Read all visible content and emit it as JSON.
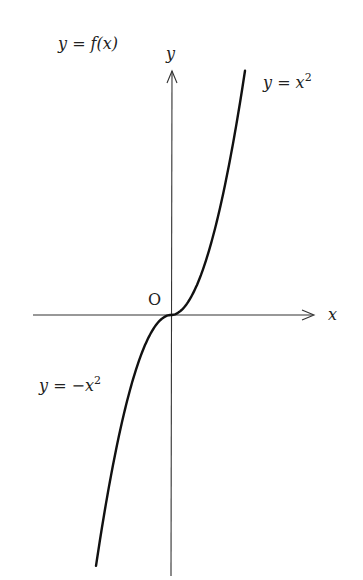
{
  "title": "y = f(x)",
  "axes": {
    "x_label": "x",
    "y_label": "y",
    "origin_label": "O"
  },
  "curves": [
    {
      "label": "y = x",
      "exponent": "2",
      "domain": "x ≥ 0",
      "expression": "x^2"
    },
    {
      "label": "y = −x",
      "exponent": "2",
      "domain": "x ≤ 0",
      "expression": "-x^2"
    }
  ],
  "colors": {
    "axis": "#333333",
    "curve": "#111111",
    "text": "#222222"
  },
  "chart_data": {
    "type": "line",
    "title": "y = f(x)",
    "xlabel": "x",
    "ylabel": "y",
    "series": [
      {
        "name": "y = x^2 (x ≥ 0)",
        "x": [
          0,
          0.5,
          1,
          1.5,
          2
        ],
        "y": [
          0,
          0.25,
          1,
          2.25,
          4
        ]
      },
      {
        "name": "y = -x^2 (x ≤ 0)",
        "x": [
          -2,
          -1.5,
          -1,
          -0.5,
          0
        ],
        "y": [
          -4,
          -2.25,
          -1,
          -0.25,
          0
        ]
      }
    ],
    "grid": false,
    "ticks": "none",
    "annotations": [
      "O",
      "y = x^2",
      "y = -x^2",
      "y = f(x)"
    ]
  }
}
